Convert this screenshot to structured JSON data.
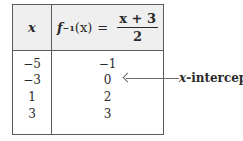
{
  "table": {
    "header": {
      "x_label": "x",
      "f_name": "f",
      "f_superscript": "−1",
      "f_arg": "(x)",
      "equals": "=",
      "numerator": "x + 3",
      "denominator": "2"
    },
    "rows": [
      {
        "x": "−5",
        "y": "−1"
      },
      {
        "x": "−3",
        "y": "0"
      },
      {
        "x": "1",
        "y": "2"
      },
      {
        "x": "3",
        "y": "3"
      }
    ]
  },
  "annotation": {
    "var": "x",
    "text": "-intercept"
  }
}
